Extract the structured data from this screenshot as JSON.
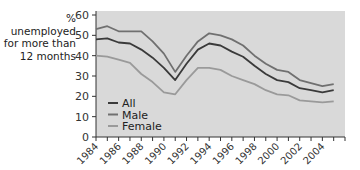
{
  "chart_data": {
    "type": "line",
    "title": "",
    "xlabel": "",
    "ylabel": "% unemployed for more than 12 months",
    "ylabel_lines": [
      "% unemployed",
      "for more than",
      "12 months"
    ],
    "ylim": [
      0,
      60
    ],
    "yticks": [
      0,
      10,
      20,
      30,
      40,
      50,
      60
    ],
    "xlim": [
      1984,
      2006
    ],
    "xtick_labels": [
      "1984",
      "1986",
      "1988",
      "1990",
      "1992",
      "1994",
      "1996",
      "1998",
      "2000",
      "2002",
      "2004"
    ],
    "grid": false,
    "legend_position": "lower-left inside",
    "background": "#d9d9d9",
    "x": [
      1984,
      1985,
      1986,
      1987,
      1988,
      1989,
      1990,
      1991,
      1992,
      1993,
      1994,
      1995,
      1996,
      1997,
      1998,
      1999,
      2000,
      2001,
      2002,
      2003,
      2004,
      2005
    ],
    "series": [
      {
        "name": "All",
        "color": "#3a3a3a",
        "values": [
          48,
          48.5,
          46.5,
          46,
          43,
          39,
          34,
          28,
          36,
          43,
          46,
          45,
          42,
          39.5,
          35,
          31,
          28,
          27,
          24,
          23,
          22,
          23
        ]
      },
      {
        "name": "Male",
        "color": "#707070",
        "values": [
          53,
          54.5,
          52,
          52,
          52,
          47,
          41,
          32,
          40,
          47,
          51,
          50,
          48,
          45,
          40,
          36,
          33,
          32,
          28,
          26.5,
          25,
          26
        ]
      },
      {
        "name": "Female",
        "color": "#9a9a9a",
        "values": [
          40,
          39.5,
          38,
          36.5,
          31,
          27,
          22,
          21,
          28,
          34,
          34,
          33,
          30,
          28,
          26,
          23,
          21,
          20.5,
          18,
          17.5,
          17,
          17.5
        ]
      }
    ]
  }
}
